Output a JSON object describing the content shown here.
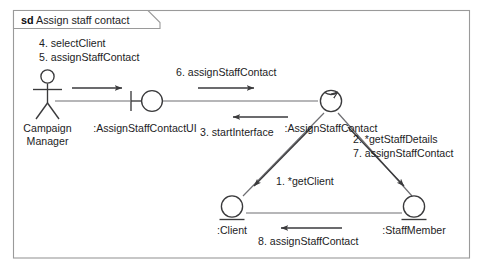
{
  "diagram": {
    "kind": "sd",
    "name": "Assign staff contact",
    "frame_label_full": "sd Assign staff contact"
  },
  "nodes": [
    {
      "id": "actor",
      "stereotype": "actor",
      "icon": "actor-stick-figure-icon",
      "label_line1": "Campaign",
      "label_line2": "Manager"
    },
    {
      "id": "boundary",
      "stereotype": "boundary",
      "icon": "boundary-icon",
      "label": ":AssignStaffContactUI"
    },
    {
      "id": "control",
      "stereotype": "control",
      "icon": "control-icon",
      "label": ":AssignStaffContact"
    },
    {
      "id": "client",
      "stereotype": "entity",
      "icon": "entity-icon",
      "label": ":Client"
    },
    {
      "id": "staffmember",
      "stereotype": "entity",
      "icon": "entity-icon",
      "label": ":StaffMember"
    }
  ],
  "messages": [
    {
      "seq": "1.",
      "name": "*getClient",
      "text": "1. *getClient",
      "from": "control",
      "to": "client",
      "direction": "down-left"
    },
    {
      "seq": "2.",
      "name": "*getStaffDetails",
      "text": "2. *getStaffDetails",
      "from": "control",
      "to": "staffmember",
      "direction": "down-right"
    },
    {
      "seq": "3.",
      "name": "startInterface",
      "text": "3. startInterface",
      "from": "control",
      "to": "boundary",
      "direction": "left"
    },
    {
      "seq": "4.",
      "name": "selectClient",
      "text": "4. selectClient",
      "from": "actor",
      "to": "boundary",
      "direction": "right"
    },
    {
      "seq": "5.",
      "name": "assignStaffContact",
      "text": "5. assignStaffContact",
      "from": "actor",
      "to": "boundary",
      "direction": "right"
    },
    {
      "seq": "6.",
      "name": "assignStaffContact",
      "text": "6. assignStaffContact",
      "from": "boundary",
      "to": "control",
      "direction": "right"
    },
    {
      "seq": "7.",
      "name": "assignStaffContact",
      "text": "7. assignStaffContact",
      "from": "control",
      "to": "staffmember",
      "direction": "down-right"
    },
    {
      "seq": "8.",
      "name": "assignStaffContact",
      "text": "8. assignStaffContact",
      "from": "staffmember",
      "to": "client",
      "direction": "left"
    }
  ],
  "colors": {
    "background": "#ffffff",
    "frame_stroke": "#9a9a9a",
    "node_stroke": "#3a3a3c",
    "link_stroke": "#6e6e72",
    "text": "#1c1c1e"
  }
}
